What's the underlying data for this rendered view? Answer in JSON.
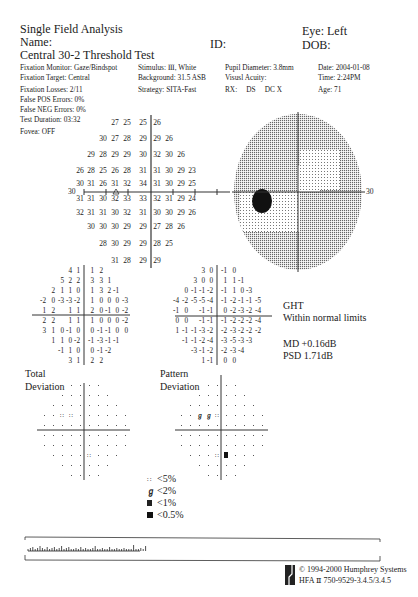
{
  "header": {
    "title": "Single Field Analysis",
    "name_label": "Name:",
    "id_label": "ID:",
    "eye_label": "Eye: Left",
    "dob_label": "DOB:",
    "test_name": "Central 30-2 Threshold Test"
  },
  "params": {
    "fixation_monitor": "Fixation Monitor: Gaze/Bindspot",
    "fixation_target": "Fixation Target: Central",
    "fixation_losses": "Fixation Losses: 2/11",
    "false_pos": "False POS Errors: 0%",
    "false_neg": "False NEG Errors: 0%",
    "test_duration": "Test Duration: 03:32",
    "fovea": "Fovea: OFF",
    "stimulus": "Stimulus: Ⅲ, White",
    "background": "Background: 31.5 ASB",
    "strategy": "Strategy: SITA-Fast",
    "pupil": "Pupil Diameter: 3.8mm",
    "visual_acuity": "Visusl Acuity:",
    "rx": "RX:     DS     DC X",
    "date": "Date: 2004-01-08",
    "time": "Time: 2:24PM",
    "age": "Age: 71"
  },
  "threshold": {
    "axis_label": "30",
    "rows": [
      [
        null,
        null,
        null,
        "27",
        "25",
        "25",
        "26",
        null,
        null,
        null
      ],
      [
        null,
        null,
        "30",
        "27",
        "28",
        "29",
        "29",
        "26",
        null,
        null
      ],
      [
        null,
        "29",
        "28",
        "29",
        "29",
        "30",
        "32",
        "30",
        "26",
        null
      ],
      [
        "26",
        "28",
        "25",
        "26",
        "28",
        "31",
        "31",
        "30",
        "29",
        "23"
      ],
      [
        "30",
        "31",
        "26",
        "31",
        "32",
        "34",
        "31",
        "30",
        "29",
        "25"
      ],
      [
        "31",
        "31",
        "30",
        "32",
        "33",
        "33",
        "32",
        "31",
        "29",
        "24"
      ],
      [
        "32",
        "31",
        "31",
        "30",
        "32",
        "31",
        "30",
        "30",
        "29",
        "26"
      ],
      [
        null,
        "30",
        "30",
        "30",
        "29",
        "29",
        "27",
        "28",
        "26",
        null
      ],
      [
        null,
        null,
        "28",
        "30",
        "29",
        "29",
        "28",
        "25",
        null,
        null
      ],
      [
        null,
        null,
        null,
        "31",
        "28",
        "29",
        "29",
        null,
        null,
        null
      ]
    ]
  },
  "grayscale": {
    "axis_label": "30"
  },
  "total_deviation": {
    "label_line1": "Total",
    "label_line2": "Deviation",
    "rows": [
      [
        null,
        null,
        null,
        "4",
        "1",
        "1",
        "2",
        null,
        null,
        null
      ],
      [
        null,
        null,
        "5",
        "2",
        "2",
        "3",
        "3",
        "1",
        null,
        null
      ],
      [
        null,
        "2",
        "1",
        "1",
        "0",
        "1",
        "3",
        "2",
        "-1",
        null
      ],
      [
        "-2",
        "0",
        "-3",
        "-3",
        "-2",
        "1",
        "0",
        "0",
        "0",
        "-3"
      ],
      [
        "1",
        "2",
        null,
        "1",
        "1",
        "2",
        "0",
        "-1",
        "0",
        "-2"
      ],
      [
        "2",
        "2",
        null,
        "1",
        "1",
        "1",
        "0",
        "0",
        "0",
        "-2"
      ],
      [
        "3",
        "1",
        "0",
        "-1",
        "0",
        "0",
        "-1",
        "-1",
        "0",
        "0"
      ],
      [
        null,
        "1",
        "1",
        "0",
        "-2",
        "-1",
        "-3",
        "-1",
        "-1",
        null
      ],
      [
        null,
        null,
        "-1",
        "1",
        "0",
        "0",
        "-1",
        "-2",
        null,
        null
      ],
      [
        null,
        null,
        null,
        "3",
        "1",
        "2",
        "2",
        null,
        null,
        null
      ]
    ]
  },
  "pattern_deviation": {
    "label_line1": "Pattern",
    "label_line2": "Deviation",
    "rows": [
      [
        null,
        null,
        null,
        "3",
        "0",
        "-1",
        "0",
        null,
        null,
        null
      ],
      [
        null,
        null,
        "3",
        "0",
        "0",
        "1",
        "1",
        "-1",
        null,
        null
      ],
      [
        null,
        "0",
        "-1",
        "-1",
        "-2",
        "-1",
        "1",
        "0",
        "-3",
        null
      ],
      [
        "-4",
        "-2",
        "-5",
        "-5",
        "-4",
        "-1",
        "-2",
        "-1",
        "-1",
        "-5"
      ],
      [
        "-1",
        "0",
        null,
        "-1",
        "-1",
        "0",
        "-2",
        "-3",
        "-2",
        "-4"
      ],
      [
        "0",
        "0",
        null,
        "-1",
        "-1",
        "-1",
        "-2",
        "-2",
        "-2",
        "-4"
      ],
      [
        "1",
        "-1",
        "-1",
        "-3",
        "-2",
        "-2",
        "-3",
        "-2",
        "-2",
        "-2"
      ],
      [
        null,
        "-1",
        "-1",
        "-2",
        "-4",
        "-3",
        "-5",
        "-3",
        "-3",
        null
      ],
      [
        null,
        null,
        "-3",
        "-1",
        "-2",
        "-2",
        "-3",
        "-4",
        null,
        null
      ],
      [
        null,
        null,
        null,
        "1",
        "-1",
        "0",
        "0",
        null,
        null,
        null
      ]
    ]
  },
  "ght": {
    "title": "GHT",
    "result": "Within normal limits",
    "md": "MD +0.16dB",
    "psd": "PSD 1.71dB"
  },
  "legend": [
    {
      "symbol": "p5",
      "label": "<5%"
    },
    {
      "symbol": "p2",
      "label": "<2%"
    },
    {
      "symbol": "p1",
      "label": "<1%"
    },
    {
      "symbol": "p05",
      "label": "<0.5%"
    }
  ],
  "footer": {
    "copyright": "© 1994-2000 Humphrey Systems",
    "version": "HFA Ⅱ 750-9529-3.4.5/3.4.5"
  }
}
